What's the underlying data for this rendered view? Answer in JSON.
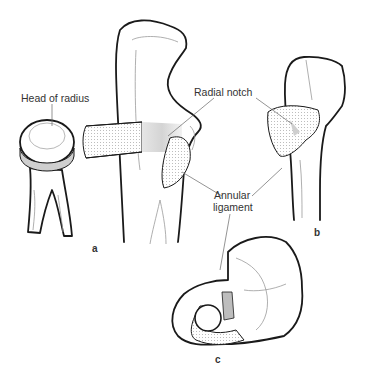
{
  "figure": {
    "type": "anatomical-diagram"
  },
  "labels": {
    "head_of_radius": "Head of radius",
    "radial_notch": "Radial notch",
    "annular_ligament_line1": "Annular",
    "annular_ligament_line2": "ligament"
  },
  "panels": {
    "a": "a",
    "b": "b",
    "c": "c"
  },
  "colors": {
    "outline": "#1a1a1a",
    "label_text": "#333333",
    "leader_line": "#666666",
    "cartilage_gray": "#bdbdbd"
  }
}
